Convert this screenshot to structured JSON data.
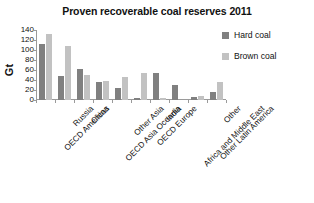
{
  "chart_data": {
    "type": "bar",
    "title": "Proven recoverable coal reserves 2011",
    "xlabel": "",
    "ylabel": "Gt",
    "ylim": [
      0,
      140
    ],
    "ytick_step": 20,
    "yticks": [
      140,
      120,
      100,
      80,
      60,
      40,
      20,
      0
    ],
    "grid": false,
    "legend_position": "top-right",
    "categories": [
      "OECD Americas",
      "Russia",
      "China",
      "OECD Asia Oceania",
      "Other Asia",
      "OECD Europe",
      "India",
      "Africa and Middle East",
      "Other Latin America",
      "Other"
    ],
    "series": [
      {
        "name": "Hard coal",
        "color": "#808080",
        "values": [
          113,
          49,
          62,
          36,
          24,
          5,
          55,
          31,
          7,
          17
        ]
      },
      {
        "name": "Brown coal",
        "color": "#c2c2c2",
        "values": [
          132,
          108,
          51,
          38,
          46,
          55,
          5,
          0,
          8,
          37
        ]
      }
    ]
  },
  "legend": {
    "items": [
      {
        "label": "Hard coal",
        "color": "#808080"
      },
      {
        "label": "Brown coal",
        "color": "#c2c2c2"
      }
    ]
  }
}
